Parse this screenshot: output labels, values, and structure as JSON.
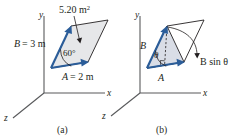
{
  "figure": {
    "type": "physics-vector-cross-product-diagram",
    "colors": {
      "axis": "#58595b",
      "vector_blue": "#2b5d99",
      "outline": "#231f20",
      "fill_gray": "#e6e7e9",
      "fill_blue_gray": "#d9dde6",
      "text": "#231f20"
    },
    "panels": [
      {
        "id": "a",
        "caption": "(a)",
        "axes": {
          "x_label": "x",
          "y_label": "y",
          "z_label": "z"
        },
        "labels": {
          "area": "5.20 m",
          "area_superscript": "2",
          "vector_b": "B",
          "vector_b_value": "= 3 m",
          "vector_a": "A",
          "vector_a_value": "= 2 m",
          "angle": "60°"
        }
      },
      {
        "id": "b",
        "caption": "(b)",
        "axes": {
          "x_label": "x",
          "y_label": "y",
          "z_label": "z"
        },
        "labels": {
          "vector_b": "B",
          "vector_a": "A",
          "angle": "θ",
          "height": "B sin θ"
        }
      }
    ]
  }
}
